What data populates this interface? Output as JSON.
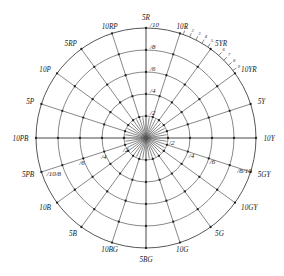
{
  "figure": {
    "name": "munsell-hue-chroma-circle",
    "background": "#ffffff",
    "line_color": "#555555",
    "node_color": "#222222",
    "text_color": "#1a1a1a"
  },
  "geometry": {
    "center_x": 146,
    "center_y": 138,
    "outer_radius": 110,
    "ring_radii": [
      22,
      44,
      66,
      88,
      110
    ],
    "spoke_count": 20,
    "major_spoke_count": 4
  },
  "chart_data": {
    "type": "polar-grid",
    "title": "",
    "xlabel": "",
    "ylabel": "",
    "radial_axis_name": "chroma",
    "angular_axis_name": "hue",
    "chroma_rings": [
      2,
      4,
      6,
      8,
      10
    ],
    "hue_labels": [
      {
        "label": "10Y",
        "angle_deg": 0,
        "anchor": "start"
      },
      {
        "label": "5Y",
        "angle_deg": 18,
        "anchor": "start"
      },
      {
        "label": "10YR",
        "angle_deg": 36,
        "anchor": "start"
      },
      {
        "label": "5YR",
        "angle_deg": 54,
        "anchor": "start"
      },
      {
        "label": "10R",
        "angle_deg": 72,
        "anchor": "middle"
      },
      {
        "label": "5R",
        "angle_deg": 90,
        "anchor": "middle"
      },
      {
        "label": "10RP",
        "angle_deg": 108,
        "anchor": "middle"
      },
      {
        "label": "5RP",
        "angle_deg": 126,
        "anchor": "end"
      },
      {
        "label": "10P",
        "angle_deg": 144,
        "anchor": "end"
      },
      {
        "label": "5P",
        "angle_deg": 162,
        "anchor": "end"
      },
      {
        "label": "10PB",
        "angle_deg": 180,
        "anchor": "end"
      },
      {
        "label": "5PB",
        "angle_deg": 198,
        "anchor": "end"
      },
      {
        "label": "10B",
        "angle_deg": 216,
        "anchor": "end"
      },
      {
        "label": "5B",
        "angle_deg": 234,
        "anchor": "end"
      },
      {
        "label": "10BG",
        "angle_deg": 252,
        "anchor": "middle"
      },
      {
        "label": "5BG",
        "angle_deg": 270,
        "anchor": "middle"
      },
      {
        "label": "10G",
        "angle_deg": 288,
        "anchor": "middle"
      },
      {
        "label": "5G",
        "angle_deg": 306,
        "anchor": "start"
      },
      {
        "label": "10GY",
        "angle_deg": 324,
        "anchor": "start"
      },
      {
        "label": "5GY",
        "angle_deg": 342,
        "anchor": "start"
      }
    ],
    "chroma_labels": [
      {
        "label": "/2",
        "angle_deg": 90,
        "radius": 22,
        "dx": 4,
        "dy": -1
      },
      {
        "label": "/4",
        "angle_deg": 90,
        "radius": 44,
        "dx": 4,
        "dy": -1
      },
      {
        "label": "/6",
        "angle_deg": 90,
        "radius": 66,
        "dx": 4,
        "dy": -1
      },
      {
        "label": "/8",
        "angle_deg": 90,
        "radius": 88,
        "dx": 4,
        "dy": -1
      },
      {
        "label": "/10",
        "angle_deg": 90,
        "radius": 110,
        "dx": 4,
        "dy": -1
      },
      {
        "label": "/2",
        "angle_deg": 0,
        "radius": 22,
        "dx": 1,
        "dy": 7
      },
      {
        "label": "/4",
        "angle_deg": 342,
        "radius": 44,
        "dx": 1,
        "dy": 6
      },
      {
        "label": "/6",
        "angle_deg": 342,
        "radius": 66,
        "dx": 1,
        "dy": 6
      },
      {
        "label": "/8/10",
        "angle_deg": 342,
        "radius": 95,
        "dx": 1,
        "dy": 6
      },
      {
        "label": "/2",
        "angle_deg": 198,
        "radius": 22,
        "dx": -2,
        "dy": 7
      },
      {
        "label": "/4",
        "angle_deg": 198,
        "radius": 44,
        "dx": -3,
        "dy": 7
      },
      {
        "label": "/6",
        "angle_deg": 198,
        "radius": 66,
        "dx": -4,
        "dy": 7
      },
      {
        "label": "/10/8",
        "angle_deg": 198,
        "radius": 96,
        "dx": -8,
        "dy": 8
      }
    ],
    "outer_ticks": [
      {
        "label": "1",
        "angle_deg": 70.2
      },
      {
        "label": "2",
        "angle_deg": 66.6
      },
      {
        "label": "3",
        "angle_deg": 63.0
      },
      {
        "label": "4",
        "angle_deg": 59.4
      },
      {
        "label": "5",
        "angle_deg": 55.8
      },
      {
        "label": "6",
        "angle_deg": 48.6
      },
      {
        "label": "7",
        "angle_deg": 45.0
      },
      {
        "label": "8",
        "angle_deg": 41.4
      },
      {
        "label": "9",
        "angle_deg": 37.8
      }
    ]
  }
}
